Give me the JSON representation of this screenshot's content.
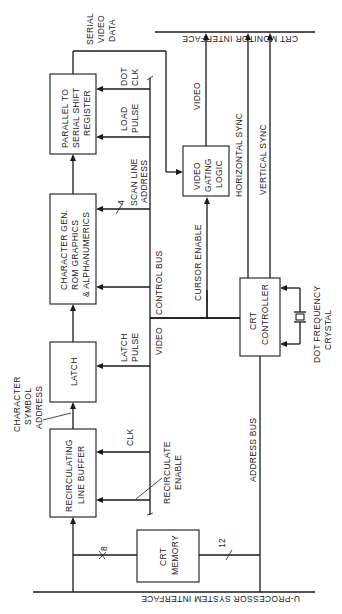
{
  "diagram": {
    "orientation": "rotated 90 degrees counter-clockwise",
    "interfaces": {
      "top": "CRT MONITOR INTERFACE",
      "bottom": "U-PROCESSOR SYSTEM INTERFACE"
    },
    "blocks": {
      "shift_register": [
        "PARALLEL TO",
        "SERIAL SHIFT",
        "REGISTER"
      ],
      "char_gen": [
        "CHARACTER GEN.",
        "ROM GRAPHICS",
        "& ALPHANUMERICS"
      ],
      "latch": [
        "LATCH"
      ],
      "line_buffer": [
        "RECIRCULATING",
        "LINE BUFFER"
      ],
      "crt_memory": [
        "CRT",
        "MEMORY"
      ],
      "video_gating": [
        "VIDEO",
        "GATING",
        "LOGIC"
      ],
      "crt_controller": [
        "CRT",
        "CONTROLLER"
      ]
    },
    "signals": {
      "serial_video_data": [
        "SERIAL",
        "VIDEO",
        "DATA"
      ],
      "dot_clk": [
        "DOT",
        "CLK"
      ],
      "load_pulse": [
        "LOAD",
        "PULSE"
      ],
      "scan_line_address": [
        "SCAN LINE",
        "ADDRESS"
      ],
      "scan_line_width": "4",
      "control_bus": "CONTROL BUS",
      "video_bus": "VIDEO",
      "latch_pulse": [
        "LATCH",
        "PULSE"
      ],
      "char_symbol_address": [
        "CHARACTER",
        "SYMBOL",
        "ADDRESS"
      ],
      "clk": "CLK",
      "recirculate_enable": [
        "RECIRCULATE",
        "ENABLE"
      ],
      "data_width_8": "8",
      "address_width_12": "12",
      "address_bus": "ADDRESS BUS",
      "video_out": "VIDEO",
      "horizontal_sync": "HORIZONTAL SYNC",
      "vertical_sync": "VERTICAL SYNC",
      "cursor_enable": "CURSOR ENABLE",
      "dot_frequency_crystal": [
        "DOT FREQUENCY",
        "CRYSTAL"
      ]
    }
  }
}
